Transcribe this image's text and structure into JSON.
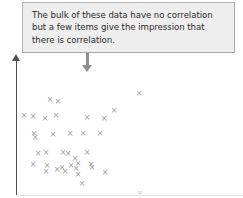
{
  "callout": {
    "name": "annotation-callout",
    "text": "The bulk of these data have no correlation\nbut a few items give the impression that\nthere is correlation.",
    "fill_color": "#eeeeee",
    "border_color": "#b4b4b4",
    "text_color": "#2b2b2b"
  },
  "pointer": {
    "name": "callout-pointer-arrow",
    "direction": "down",
    "color": "#8e8e8e"
  },
  "axes": {
    "y_axis": {
      "label": "",
      "color": "#4f4f4f",
      "arrow": "up"
    },
    "x_axis": {
      "label": "",
      "color": "#e2e2e2",
      "arrow": "right"
    }
  },
  "chart_data": {
    "type": "scatter",
    "title": "",
    "subtitle": "",
    "xlabel": "",
    "ylabel": "",
    "grid": false,
    "legend": null,
    "annotations": [
      {
        "text": "The bulk of these data have no correlation but a few items give the impression that there is correlation.",
        "points_to": "scatter-cloud"
      }
    ],
    "marker": {
      "symbol": "x",
      "color": "#9b9b9b",
      "size": 7
    },
    "xlim": [
      0,
      243
    ],
    "ylim": [
      198,
      0
    ],
    "note": "Coordinates are given in screenshot pixel space (x right, y down).",
    "n_points": 36,
    "points": [
      {
        "x": 139,
        "y": 93
      },
      {
        "x": 50,
        "y": 99
      },
      {
        "x": 58,
        "y": 101
      },
      {
        "x": 114,
        "y": 110
      },
      {
        "x": 24,
        "y": 115
      },
      {
        "x": 33,
        "y": 116
      },
      {
        "x": 45,
        "y": 118
      },
      {
        "x": 56,
        "y": 115
      },
      {
        "x": 87,
        "y": 117
      },
      {
        "x": 104,
        "y": 118
      },
      {
        "x": 34,
        "y": 133
      },
      {
        "x": 53,
        "y": 134
      },
      {
        "x": 70,
        "y": 133
      },
      {
        "x": 83,
        "y": 133
      },
      {
        "x": 100,
        "y": 133
      },
      {
        "x": 35,
        "y": 137
      },
      {
        "x": 46,
        "y": 152
      },
      {
        "x": 63,
        "y": 152
      },
      {
        "x": 68,
        "y": 153
      },
      {
        "x": 75,
        "y": 158
      },
      {
        "x": 87,
        "y": 152
      },
      {
        "x": 38,
        "y": 153
      },
      {
        "x": 33,
        "y": 164
      },
      {
        "x": 47,
        "y": 165
      },
      {
        "x": 57,
        "y": 169
      },
      {
        "x": 62,
        "y": 167
      },
      {
        "x": 65,
        "y": 171
      },
      {
        "x": 71,
        "y": 165
      },
      {
        "x": 76,
        "y": 168
      },
      {
        "x": 78,
        "y": 163
      },
      {
        "x": 91,
        "y": 164
      },
      {
        "x": 92,
        "y": 167
      },
      {
        "x": 105,
        "y": 172
      },
      {
        "x": 46,
        "y": 171
      },
      {
        "x": 82,
        "y": 183
      },
      {
        "x": 78,
        "y": 174
      }
    ]
  }
}
